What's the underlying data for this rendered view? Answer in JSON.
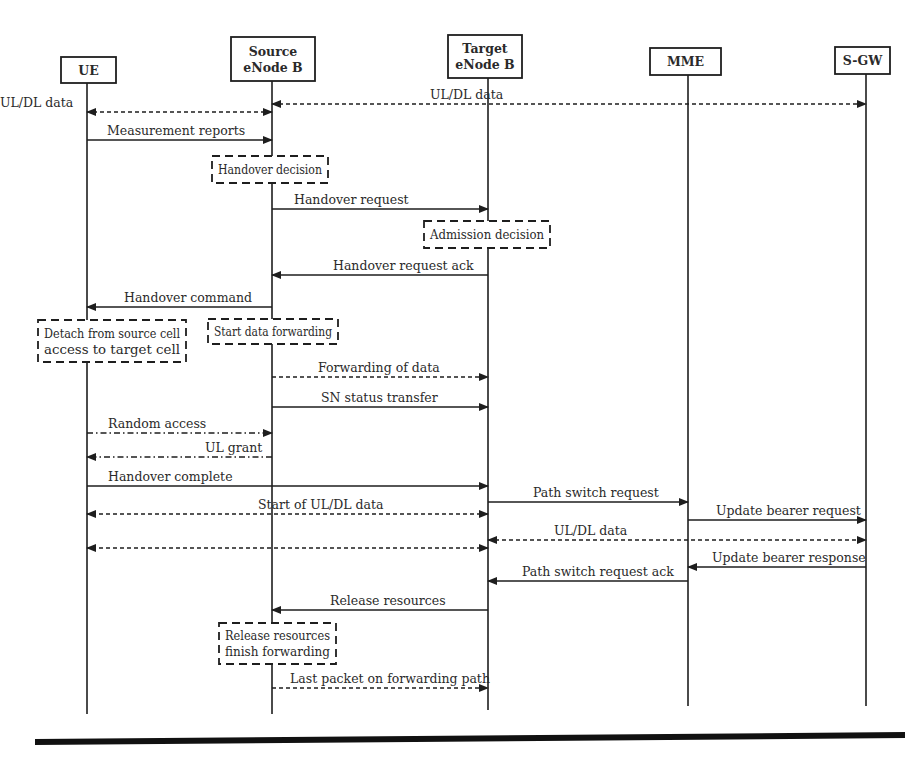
{
  "diagram": {
    "colors": {
      "ink": "#1e1e1e",
      "text": "#2a2a2a",
      "background": "#ffffff"
    },
    "participants": [
      {
        "id": "ue",
        "lines": [
          "UE"
        ],
        "x": 87,
        "box": [
          61,
          57,
          55,
          26
        ],
        "end_y": 714
      },
      {
        "id": "source",
        "lines": [
          "Source",
          "eNode B"
        ],
        "x": 272,
        "box": [
          231,
          37,
          84,
          44
        ],
        "end_y": 714
      },
      {
        "id": "target",
        "lines": [
          "Target",
          "eNode B"
        ],
        "x": 488,
        "box": [
          448,
          35,
          74,
          43
        ],
        "end_y": 710
      },
      {
        "id": "mme",
        "lines": [
          "MME"
        ],
        "x": 688,
        "box": [
          650,
          48,
          71,
          27
        ],
        "end_y": 706
      },
      {
        "id": "sgw",
        "lines": [
          "S-GW"
        ],
        "x": 866,
        "box": [
          835,
          47,
          55,
          27
        ],
        "end_y": 706
      }
    ],
    "messages": [
      {
        "label": "UL/DL data",
        "from": "source",
        "to": "ue",
        "y": 112,
        "style": "dashed",
        "bidir": true,
        "label_x": 0
      },
      {
        "label": "UL/DL data",
        "from": "source",
        "to": "sgw",
        "y": 104,
        "style": "dashed",
        "bidir": true,
        "label_x": 430
      },
      {
        "label": "Measurement reports",
        "from": "ue",
        "to": "source",
        "y": 140,
        "style": "solid",
        "label_x": 107
      },
      {
        "label": "Handover request",
        "from": "source",
        "to": "target",
        "y": 209,
        "style": "solid",
        "label_x": 294
      },
      {
        "label": "Handover request ack",
        "from": "target",
        "to": "source",
        "y": 275,
        "style": "solid",
        "label_x": 333
      },
      {
        "label": "Handover command",
        "from": "source",
        "to": "ue",
        "y": 307,
        "style": "solid",
        "label_x": 124
      },
      {
        "label": "Forwarding of data",
        "from": "source",
        "to": "target",
        "y": 377,
        "style": "dashed",
        "label_x": 318
      },
      {
        "label": "SN status transfer",
        "from": "source",
        "to": "target",
        "y": 407,
        "style": "solid",
        "label_x": 321
      },
      {
        "label": "Random access",
        "from": "ue",
        "to": "source",
        "y": 433,
        "style": "dashdot",
        "label_x": 108
      },
      {
        "label": "UL grant",
        "from": "source",
        "to": "ue",
        "y": 457,
        "style": "dashdot",
        "label_x": 205
      },
      {
        "label": "Handover complete",
        "from": "ue",
        "to": "target",
        "y": 486,
        "style": "solid",
        "label_x": 108
      },
      {
        "label": "Start of UL/DL data",
        "from": "target",
        "to": "ue",
        "y": 514,
        "style": "dashed",
        "bidir": true,
        "label_x": 258
      },
      {
        "label": "Path switch request",
        "from": "target",
        "to": "mme",
        "y": 502,
        "style": "solid",
        "label_x": 533
      },
      {
        "label": "Update bearer request",
        "from": "mme",
        "to": "sgw",
        "y": 520,
        "style": "solid",
        "label_x": 716
      },
      {
        "label": "",
        "from": "target",
        "to": "ue",
        "y": 548,
        "style": "dashed",
        "bidir": true,
        "label_x": 0
      },
      {
        "label": "UL/DL data",
        "from": "target",
        "to": "sgw",
        "y": 540,
        "style": "dashed",
        "bidir": true,
        "label_x": 554
      },
      {
        "label": "Update bearer response",
        "from": "sgw",
        "to": "mme",
        "y": 567,
        "style": "solid",
        "label_x": 712
      },
      {
        "label": "Path switch request ack",
        "from": "mme",
        "to": "target",
        "y": 581,
        "style": "solid",
        "label_x": 522
      },
      {
        "label": "Release resources",
        "from": "target",
        "to": "source",
        "y": 610,
        "style": "solid",
        "label_x": 330
      },
      {
        "label": "Last packet on forwarding path",
        "from": "source",
        "to": "target",
        "y": 688,
        "style": "dashed",
        "label_x": 290
      }
    ],
    "notes": [
      {
        "lines": [
          "Handover decision"
        ],
        "box": [
          212,
          156,
          116,
          27
        ]
      },
      {
        "lines": [
          "Admission decision"
        ],
        "box": [
          424,
          221,
          126,
          27
        ]
      },
      {
        "lines": [
          "Detach from source cell",
          "access to target cell"
        ],
        "box": [
          38,
          320,
          148,
          42
        ]
      },
      {
        "lines": [
          "Start data forwarding"
        ],
        "box": [
          208,
          319,
          130,
          25
        ]
      },
      {
        "lines": [
          "Release resources",
          "finish forwarding"
        ],
        "box": [
          219,
          623,
          117,
          41
        ]
      }
    ],
    "footer_rule": {
      "x1": 35,
      "x2": 905,
      "y1": 742,
      "y2": 735,
      "width": 6
    }
  }
}
